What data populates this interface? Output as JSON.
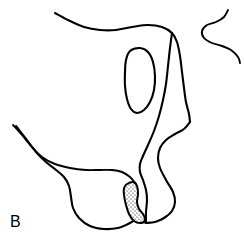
{
  "figure": {
    "panel_label": "B",
    "background_color": "#ffffff",
    "line_color": "#000000",
    "stipple_color": "#000000",
    "stipple_fill_color": "#ffffff",
    "line_width": 2.1,
    "canvas": {
      "width": 245,
      "height": 250
    }
  },
  "chart_data": {
    "type": "line",
    "title": "B",
    "subtitle": "",
    "xlabel": "",
    "ylabel": "",
    "grid": false,
    "legend": "none",
    "xlim": [
      0,
      245
    ],
    "ylim": [
      0,
      250
    ],
    "series": [
      {
        "name": "upper-outer-contour",
        "closed": false,
        "points": [
          [
            55,
            13
          ],
          [
            68,
            20
          ],
          [
            84,
            27
          ],
          [
            100,
            30
          ],
          [
            116,
            30
          ],
          [
            132,
            27
          ],
          [
            148,
            25
          ],
          [
            162,
            27
          ],
          [
            172,
            33
          ],
          [
            177,
            42
          ],
          [
            180,
            56
          ],
          [
            182,
            72
          ],
          [
            184,
            88
          ],
          [
            186,
            102
          ],
          [
            189,
            114
          ],
          [
            190,
            122
          ]
        ]
      },
      {
        "name": "right-outer-contour",
        "closed": false,
        "points": [
          [
            190,
            122
          ],
          [
            184,
            129
          ],
          [
            175,
            134
          ],
          [
            166,
            140
          ],
          [
            160,
            148
          ],
          [
            158,
            158
          ],
          [
            160,
            168
          ],
          [
            166,
            180
          ],
          [
            173,
            192
          ],
          [
            175,
            202
          ],
          [
            172,
            211
          ],
          [
            164,
            218
          ],
          [
            155,
            222
          ],
          [
            146,
            223
          ]
        ]
      },
      {
        "name": "right-inner-contour",
        "closed": false,
        "points": [
          [
            172,
            33
          ],
          [
            170,
            48
          ],
          [
            168,
            66
          ],
          [
            166,
            84
          ],
          [
            163,
            100
          ],
          [
            159,
            116
          ],
          [
            154,
            131
          ],
          [
            148,
            145
          ],
          [
            143,
            156
          ],
          [
            140,
            164
          ],
          [
            140,
            172
          ],
          [
            143,
            180
          ],
          [
            146,
            190
          ],
          [
            147,
            200
          ],
          [
            146,
            212
          ],
          [
            146,
            223
          ]
        ]
      },
      {
        "name": "right-s-hook",
        "closed": false,
        "points": [
          [
            228,
            10
          ],
          [
            224,
            17
          ],
          [
            216,
            22
          ],
          [
            207,
            25
          ],
          [
            202,
            31
          ],
          [
            204,
            38
          ],
          [
            212,
            43
          ],
          [
            222,
            46
          ],
          [
            231,
            50
          ],
          [
            238,
            57
          ],
          [
            240,
            63
          ]
        ]
      },
      {
        "name": "left-upper-parallel",
        "closed": false,
        "points": [
          [
            13,
            125
          ],
          [
            22,
            135
          ],
          [
            32,
            147
          ],
          [
            42,
            157
          ],
          [
            55,
            164
          ],
          [
            70,
            168
          ],
          [
            86,
            170
          ],
          [
            100,
            170
          ],
          [
            112,
            170
          ],
          [
            122,
            172
          ],
          [
            130,
            177
          ],
          [
            136,
            184
          ]
        ]
      },
      {
        "name": "left-lower-parallel",
        "closed": false,
        "points": [
          [
            16,
            126
          ],
          [
            26,
            139
          ],
          [
            36,
            152
          ],
          [
            46,
            162
          ],
          [
            56,
            170
          ],
          [
            64,
            177
          ],
          [
            69,
            186
          ],
          [
            71,
            197
          ],
          [
            73,
            208
          ],
          [
            79,
            218
          ],
          [
            90,
            226
          ],
          [
            104,
            229
          ],
          [
            118,
            228
          ],
          [
            128,
            224
          ],
          [
            136,
            220
          ],
          [
            142,
            221
          ],
          [
            146,
            223
          ]
        ]
      },
      {
        "name": "inner-oval-inclusion",
        "closed": true,
        "points": [
          [
            130,
            51
          ],
          [
            140,
            48
          ],
          [
            148,
            52
          ],
          [
            153,
            62
          ],
          [
            155,
            76
          ],
          [
            154,
            90
          ],
          [
            150,
            102
          ],
          [
            144,
            110
          ],
          [
            137,
            113
          ],
          [
            131,
            109
          ],
          [
            127,
            99
          ],
          [
            125,
            86
          ],
          [
            125,
            72
          ],
          [
            126,
            60
          ]
        ]
      },
      {
        "name": "stippled-body",
        "closed": true,
        "stippled": true,
        "points": [
          [
            127,
            184
          ],
          [
            133,
            182
          ],
          [
            137,
            186
          ],
          [
            138,
            194
          ],
          [
            137,
            202
          ],
          [
            139,
            209
          ],
          [
            143,
            214
          ],
          [
            145,
            220
          ],
          [
            141,
            223
          ],
          [
            134,
            221
          ],
          [
            129,
            214
          ],
          [
            126,
            205
          ],
          [
            124,
            195
          ],
          [
            124,
            188
          ]
        ]
      }
    ]
  }
}
